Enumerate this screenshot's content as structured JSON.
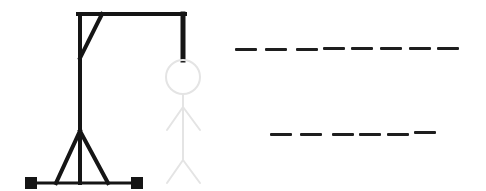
{
  "game": {
    "type": "hangman",
    "colors": {
      "gallows": "#151515",
      "figure_hidden": "#e4e4e4",
      "slot": "#1e1e1e",
      "background": "#ffffff"
    },
    "gallows": {
      "post": {
        "x": 80,
        "y1": 14,
        "y2": 183
      },
      "beam": {
        "y": 14,
        "x1": 78,
        "x2": 186
      },
      "rope": {
        "x": 183,
        "y1": 14,
        "y2": 60
      },
      "brace": {
        "x1": 102,
        "y1": 14,
        "x2": 80,
        "y2": 58
      },
      "base": {
        "y": 183,
        "x1": 30,
        "x2": 138
      },
      "a_frame": {
        "apex_x": 80,
        "apex_y": 130,
        "left_x": 55,
        "right_x": 108,
        "foot_y": 183
      },
      "feet": [
        {
          "x": 25,
          "y": 177,
          "size": 12
        },
        {
          "x": 131,
          "y": 177,
          "size": 12
        }
      ]
    },
    "figure": {
      "head": {
        "cx": 183,
        "cy": 77,
        "r": 17
      },
      "body": {
        "x": 183,
        "y1": 94,
        "y2": 160
      },
      "arms": {
        "shoulder_y": 107,
        "hand_y": 130,
        "left_x": 167,
        "right_x": 200
      },
      "legs": {
        "hip_y": 160,
        "foot_y": 183,
        "left_x": 167,
        "right_x": 200
      }
    },
    "word_rows": [
      {
        "label": "first-word",
        "letter_count": 8,
        "letters": [
          "",
          "",
          "",
          "",
          "",
          "",
          "",
          ""
        ],
        "x": 235,
        "y": 49,
        "slot_width": 22,
        "gap": 7
      },
      {
        "label": "second-word",
        "letter_count": 6,
        "letters": [
          "",
          "",
          "",
          "",
          "",
          ""
        ],
        "x": 270,
        "y": 133,
        "slot_width": 22,
        "gap": 7
      }
    ]
  }
}
